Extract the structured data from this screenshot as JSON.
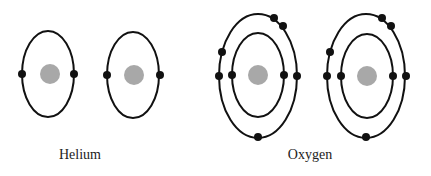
{
  "labels": {
    "helium": "Helium",
    "oxygen": "Oxygen"
  },
  "colors": {
    "orbit": "#111111",
    "electron": "#111111",
    "nucleus": "#a8a8a8",
    "background": "#ffffff"
  },
  "atoms": [
    {
      "element": "Helium",
      "shells": [
        {
          "cx": 48,
          "cy": 74,
          "rx": 26,
          "ry": 43,
          "electrons": 2
        }
      ],
      "nucleus": {
        "cx": 50,
        "cy": 74,
        "r": 10
      }
    },
    {
      "element": "Helium",
      "shells": [
        {
          "cx": 133,
          "cy": 75,
          "rx": 26,
          "ry": 43,
          "electrons": 2
        }
      ],
      "nucleus": {
        "cx": 134,
        "cy": 75,
        "r": 10
      }
    },
    {
      "element": "Oxygen",
      "shells": [
        {
          "cx": 258,
          "cy": 75,
          "rx": 26,
          "ry": 42,
          "electrons": 2
        },
        {
          "cx": 258,
          "cy": 76,
          "rx": 39,
          "ry": 62,
          "electrons": 6
        }
      ],
      "nucleus": {
        "cx": 258,
        "cy": 75,
        "r": 10
      }
    },
    {
      "element": "Oxygen",
      "shells": [
        {
          "cx": 367,
          "cy": 76,
          "rx": 26,
          "ry": 42,
          "electrons": 2
        },
        {
          "cx": 366,
          "cy": 76,
          "rx": 39,
          "ry": 62,
          "electrons": 6
        }
      ],
      "nucleus": {
        "cx": 367,
        "cy": 76,
        "r": 10
      }
    }
  ]
}
